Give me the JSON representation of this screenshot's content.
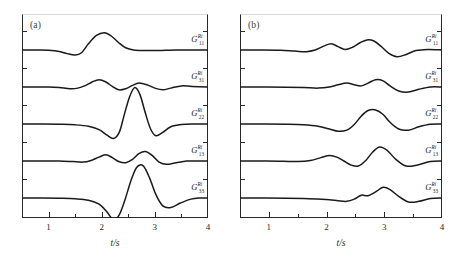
{
  "figure": {
    "background": "#ffffff",
    "line_color": "#1a1a1a",
    "axis_color": "#2a2a2a"
  },
  "panels": [
    {
      "id": "a",
      "tag": "(a)",
      "xlabel": "t/s",
      "xticks": [
        "1",
        "2",
        "3",
        "4"
      ]
    },
    {
      "id": "b",
      "tag": "(b)",
      "xlabel": "t/s",
      "xticks": [
        "1",
        "2",
        "3",
        "4"
      ]
    }
  ],
  "trace_labels": {
    "base": "G",
    "sup": "Ri",
    "subs": [
      "11",
      "31",
      "22",
      "13",
      "33"
    ]
  },
  "chart_data": {
    "type": "line",
    "title": "",
    "xlabel": "t/s",
    "ylabel": "",
    "xlim": [
      0.5,
      4.0
    ],
    "ylim": [
      0,
      5
    ],
    "grid": false,
    "legend": "none",
    "panels": [
      {
        "panel": "a",
        "tag": "(a)",
        "xticks": [
          1,
          2,
          3,
          4
        ],
        "series": [
          {
            "name": "G_11^Ri",
            "label_sub": "11",
            "baseline": 0,
            "x": [
              0.5,
              0.8,
              1.0,
              1.2,
              1.35,
              1.5,
              1.62,
              1.75,
              1.9,
              2.05,
              2.18,
              2.32,
              2.45,
              2.6,
              2.8,
              3.0,
              3.2,
              3.4,
              3.6,
              3.8,
              4.0
            ],
            "y": [
              0.0,
              0.0,
              -0.01,
              -0.05,
              -0.13,
              -0.18,
              -0.1,
              0.22,
              0.52,
              0.62,
              0.5,
              0.26,
              0.08,
              0.0,
              -0.02,
              -0.02,
              -0.01,
              0.0,
              0.0,
              0.0,
              0.0
            ]
          },
          {
            "name": "G_31^Ri",
            "label_sub": "31",
            "baseline": 1,
            "x": [
              0.5,
              0.8,
              1.0,
              1.2,
              1.4,
              1.55,
              1.7,
              1.82,
              1.95,
              2.08,
              2.2,
              2.32,
              2.45,
              2.58,
              2.7,
              2.85,
              3.0,
              3.15,
              3.3,
              3.5,
              3.7,
              4.0
            ],
            "y": [
              0.0,
              0.0,
              0.0,
              -0.02,
              -0.06,
              -0.04,
              0.06,
              0.18,
              0.26,
              0.18,
              0.02,
              -0.1,
              -0.06,
              0.06,
              0.14,
              0.08,
              -0.04,
              -0.1,
              -0.04,
              0.04,
              0.02,
              0.0
            ]
          },
          {
            "name": "G_22^Ri",
            "label_sub": "22",
            "baseline": 2,
            "x": [
              0.5,
              0.9,
              1.2,
              1.5,
              1.75,
              1.95,
              2.1,
              2.22,
              2.33,
              2.42,
              2.52,
              2.62,
              2.72,
              2.82,
              2.92,
              3.02,
              3.15,
              3.3,
              3.5,
              3.75,
              4.0
            ],
            "y": [
              0.0,
              0.0,
              -0.01,
              -0.03,
              -0.08,
              -0.2,
              -0.4,
              -0.52,
              -0.3,
              0.3,
              0.95,
              1.3,
              1.05,
              0.4,
              -0.18,
              -0.42,
              -0.3,
              -0.1,
              -0.02,
              0.0,
              0.0
            ]
          },
          {
            "name": "G_13^Ri",
            "label_sub": "13",
            "baseline": 3,
            "x": [
              0.5,
              0.9,
              1.2,
              1.45,
              1.65,
              1.8,
              1.95,
              2.08,
              2.2,
              2.32,
              2.45,
              2.58,
              2.7,
              2.82,
              2.95,
              3.08,
              3.22,
              3.4,
              3.6,
              3.8,
              4.0
            ],
            "y": [
              0.0,
              0.0,
              0.0,
              -0.02,
              -0.04,
              0.02,
              0.14,
              0.22,
              0.12,
              -0.02,
              -0.06,
              0.06,
              0.26,
              0.34,
              0.2,
              -0.04,
              -0.12,
              -0.06,
              0.0,
              0.0,
              0.0
            ]
          },
          {
            "name": "G_33^Ri",
            "label_sub": "33",
            "baseline": 4,
            "x": [
              0.5,
              0.9,
              1.2,
              1.5,
              1.75,
              1.95,
              2.1,
              2.22,
              2.33,
              2.44,
              2.55,
              2.66,
              2.78,
              2.9,
              3.02,
              3.15,
              3.3,
              3.48,
              3.68,
              3.85,
              4.0
            ],
            "y": [
              0.0,
              0.0,
              -0.01,
              -0.03,
              -0.08,
              -0.22,
              -0.5,
              -0.78,
              -0.6,
              -0.05,
              0.62,
              1.1,
              1.15,
              0.72,
              0.12,
              -0.28,
              -0.34,
              -0.18,
              -0.04,
              0.0,
              0.0
            ]
          }
        ]
      },
      {
        "panel": "b",
        "tag": "(b)",
        "xticks": [
          1,
          2,
          3,
          4
        ],
        "series": [
          {
            "name": "G_11^Ri",
            "label_sub": "11",
            "baseline": 0,
            "x": [
              0.5,
              0.9,
              1.2,
              1.45,
              1.65,
              1.8,
              1.95,
              2.08,
              2.2,
              2.32,
              2.45,
              2.58,
              2.7,
              2.82,
              2.95,
              3.08,
              3.22,
              3.38,
              3.55,
              3.75,
              4.0
            ],
            "y": [
              0.0,
              0.0,
              -0.01,
              -0.04,
              -0.06,
              0.0,
              0.14,
              0.22,
              0.12,
              0.02,
              0.1,
              0.26,
              0.36,
              0.32,
              0.12,
              -0.12,
              -0.24,
              -0.16,
              -0.02,
              0.02,
              0.0
            ]
          },
          {
            "name": "G_21^Ri",
            "label_sub": "31",
            "baseline": 1,
            "x": [
              0.5,
              0.95,
              1.3,
              1.6,
              1.85,
              2.05,
              2.2,
              2.35,
              2.48,
              2.6,
              2.72,
              2.85,
              2.98,
              3.1,
              3.25,
              3.42,
              3.6,
              3.8,
              4.0
            ],
            "y": [
              0.0,
              0.0,
              -0.01,
              -0.02,
              -0.04,
              0.0,
              0.08,
              0.14,
              0.08,
              0.04,
              0.14,
              0.26,
              0.22,
              0.04,
              -0.14,
              -0.18,
              -0.08,
              0.0,
              0.0
            ]
          },
          {
            "name": "G_22^Ri",
            "label_sub": "22",
            "baseline": 2,
            "x": [
              0.5,
              0.95,
              1.3,
              1.6,
              1.85,
              2.05,
              2.2,
              2.35,
              2.48,
              2.6,
              2.72,
              2.85,
              2.98,
              3.1,
              3.25,
              3.42,
              3.6,
              3.8,
              4.0
            ],
            "y": [
              0.0,
              0.0,
              -0.01,
              -0.03,
              -0.08,
              -0.18,
              -0.26,
              -0.22,
              -0.02,
              0.28,
              0.48,
              0.5,
              0.34,
              0.06,
              -0.18,
              -0.22,
              -0.1,
              -0.01,
              0.0
            ]
          },
          {
            "name": "G_13^Ri",
            "label_sub": "13",
            "baseline": 3,
            "x": [
              0.5,
              0.95,
              1.25,
              1.5,
              1.72,
              1.9,
              2.05,
              2.18,
              2.3,
              2.42,
              2.55,
              2.68,
              2.8,
              2.92,
              3.05,
              3.2,
              3.38,
              3.58,
              3.8,
              4.0
            ],
            "y": [
              0.0,
              0.0,
              -0.01,
              -0.02,
              0.02,
              0.12,
              0.2,
              0.14,
              0.0,
              -0.14,
              -0.18,
              0.02,
              0.32,
              0.5,
              0.38,
              0.06,
              -0.18,
              -0.14,
              -0.02,
              0.0
            ]
          },
          {
            "name": "G_33^Ri",
            "label_sub": "33",
            "baseline": 4,
            "x": [
              0.5,
              0.95,
              1.3,
              1.6,
              1.85,
              2.05,
              2.2,
              2.35,
              2.48,
              2.6,
              2.72,
              2.85,
              2.98,
              3.1,
              3.25,
              3.42,
              3.6,
              3.8,
              4.0
            ],
            "y": [
              0.0,
              0.0,
              -0.01,
              -0.02,
              -0.04,
              -0.06,
              -0.1,
              -0.12,
              -0.04,
              0.1,
              0.08,
              0.22,
              0.38,
              0.3,
              0.06,
              -0.14,
              -0.12,
              -0.02,
              0.0
            ]
          }
        ]
      }
    ]
  }
}
